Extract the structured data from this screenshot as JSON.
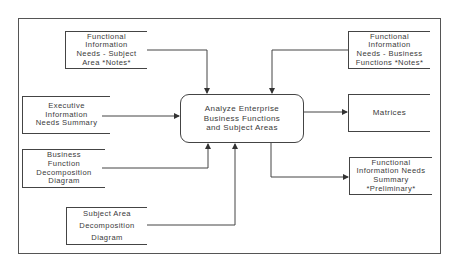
{
  "diagram": {
    "type": "process-flow (IDEF0-style context diagram)",
    "process": {
      "label": "Analyze Enterprise\nBusiness Functions\nand Subject Areas"
    },
    "inputs": [
      {
        "id": "fin-subject-area",
        "label": "Functional\nInformation\nNeeds  - Subject\nArea    *Notes*",
        "direction": "top"
      },
      {
        "id": "exec-summary",
        "label": "Executive\nInformation\nNeeds Summary",
        "direction": "left"
      },
      {
        "id": "bf-decomp",
        "label": "Business\nFunction\nDecomposition\nDiagram",
        "direction": "bottom"
      },
      {
        "id": "sa-decomp",
        "label": "Subject  Area\nDecomposition\nDiagram",
        "direction": "bottom"
      },
      {
        "id": "fin-business-functions",
        "label": "Functional\nInformation\nNeeds - Business\nFunctions  *Notes*",
        "direction": "top"
      }
    ],
    "outputs": [
      {
        "id": "matrices",
        "label": "Matrices"
      },
      {
        "id": "fin-summary",
        "label": "Functional\nInformation  Needs\nSummary\n*Preliminary*"
      }
    ],
    "colors": {
      "line": "#444444",
      "text": "#3a3a3a",
      "background": "#ffffff"
    }
  }
}
